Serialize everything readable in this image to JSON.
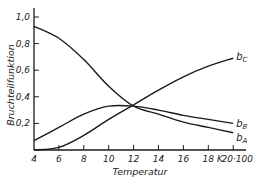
{
  "chart_data": {
    "type": "line",
    "title": "",
    "xlabel": "Temperatur",
    "ylabel": "Bruchteilfunktion",
    "x_unit": "K",
    "x": [
      4,
      6,
      8,
      10,
      12,
      14,
      16,
      18,
      20
    ],
    "x_tick_labels": [
      "4",
      "6",
      "8",
      "10",
      "12",
      "14",
      "16",
      "18",
      "20·100"
    ],
    "y_tick_labels": [
      "0,2",
      "0,4",
      "0,6",
      "0,8",
      "1,0"
    ],
    "y_ticks": [
      0.2,
      0.4,
      0.6,
      0.8,
      1.0
    ],
    "xlim": [
      4,
      20.8
    ],
    "ylim": [
      0,
      1.05
    ],
    "grid": false,
    "legend": "inline labels at line ends",
    "series": [
      {
        "name": "b_A",
        "label_main": "b",
        "label_sub": "A",
        "values": [
          0.93,
          0.84,
          0.68,
          0.48,
          0.33,
          0.27,
          0.21,
          0.17,
          0.13
        ]
      },
      {
        "name": "b_B",
        "label_main": "b",
        "label_sub": "B",
        "values": [
          0.07,
          0.17,
          0.27,
          0.33,
          0.33,
          0.3,
          0.26,
          0.23,
          0.2
        ]
      },
      {
        "name": "b_C",
        "label_main": "b",
        "label_sub": "C",
        "values": [
          0.0,
          0.02,
          0.11,
          0.23,
          0.34,
          0.45,
          0.55,
          0.63,
          0.69
        ]
      }
    ],
    "annotations": [
      "K (unit marker between 18 and 20·100)"
    ]
  },
  "colors": {
    "line": "#1a1a1a",
    "background": "#ffffff",
    "text": "#222222"
  }
}
